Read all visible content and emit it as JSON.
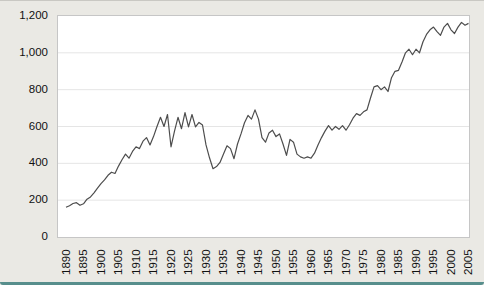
{
  "figure": {
    "background_color": "#eae9e4",
    "plot_background_color": "#ffffff",
    "plot_border_color": "#c6c6c6",
    "gridline_color": "#e5e5e5",
    "accent_bar_color": "#3d7e7d",
    "tick_label_color": "#111111"
  },
  "chart_data": {
    "type": "line",
    "title": "",
    "xlabel": "",
    "ylabel": "",
    "legend": "none",
    "grid": "horizontal",
    "line_color": "#4d4d4d",
    "ylim": [
      0,
      1200
    ],
    "yticks": [
      0,
      200,
      400,
      600,
      800,
      1000,
      1200
    ],
    "ytick_labels": [
      "0",
      "200",
      "400",
      "600",
      "800",
      "1,000",
      "1,200"
    ],
    "x_start": 1890,
    "x_end": 2005,
    "xticks": [
      1890,
      1895,
      1900,
      1905,
      1910,
      1915,
      1920,
      1925,
      1930,
      1935,
      1940,
      1945,
      1950,
      1955,
      1960,
      1965,
      1970,
      1975,
      1980,
      1985,
      1990,
      1995,
      2000,
      2005
    ],
    "xtick_labels": [
      "1890",
      "1895",
      "1900",
      "1905",
      "1910",
      "1915",
      "1920",
      "1925",
      "1930",
      "1935",
      "1940",
      "1945",
      "1950",
      "1955",
      "1960",
      "1965",
      "1970",
      "1975",
      "1980",
      "1985",
      "1990",
      "1995",
      "2000",
      "2005"
    ],
    "x": [
      1890,
      1891,
      1892,
      1893,
      1894,
      1895,
      1896,
      1897,
      1898,
      1899,
      1900,
      1901,
      1902,
      1903,
      1904,
      1905,
      1906,
      1907,
      1908,
      1909,
      1910,
      1911,
      1912,
      1913,
      1914,
      1915,
      1916,
      1917,
      1918,
      1919,
      1920,
      1921,
      1922,
      1923,
      1924,
      1925,
      1926,
      1927,
      1928,
      1929,
      1930,
      1931,
      1932,
      1933,
      1934,
      1935,
      1936,
      1937,
      1938,
      1939,
      1940,
      1941,
      1942,
      1943,
      1944,
      1945,
      1946,
      1947,
      1948,
      1949,
      1950,
      1951,
      1952,
      1953,
      1954,
      1955,
      1956,
      1957,
      1958,
      1959,
      1960,
      1961,
      1962,
      1963,
      1964,
      1965,
      1966,
      1967,
      1968,
      1969,
      1970,
      1971,
      1972,
      1973,
      1974,
      1975,
      1976,
      1977,
      1978,
      1979,
      1980,
      1981,
      1982,
      1983,
      1984,
      1985,
      1986,
      1987,
      1988,
      1989,
      1990,
      1991,
      1992,
      1993,
      1994,
      1995,
      1996,
      1997,
      1998,
      1999,
      2000,
      2001,
      2002,
      2003,
      2004,
      2005
    ],
    "values": [
      162,
      170,
      182,
      186,
      172,
      180,
      205,
      218,
      240,
      265,
      290,
      310,
      335,
      352,
      345,
      385,
      420,
      450,
      428,
      465,
      490,
      480,
      520,
      540,
      500,
      545,
      600,
      650,
      600,
      665,
      490,
      575,
      650,
      588,
      675,
      598,
      665,
      598,
      622,
      608,
      500,
      430,
      371,
      382,
      405,
      450,
      495,
      480,
      425,
      505,
      560,
      620,
      660,
      640,
      690,
      640,
      540,
      515,
      565,
      580,
      545,
      560,
      505,
      443,
      530,
      515,
      450,
      435,
      428,
      435,
      428,
      455,
      500,
      540,
      575,
      605,
      580,
      600,
      585,
      605,
      580,
      610,
      645,
      670,
      660,
      680,
      690,
      755,
      815,
      822,
      800,
      815,
      790,
      865,
      900,
      905,
      950,
      1000,
      1020,
      990,
      1020,
      1000,
      1060,
      1100,
      1125,
      1140,
      1115,
      1095,
      1140,
      1160,
      1125,
      1105,
      1140,
      1165,
      1150,
      1160
    ]
  }
}
